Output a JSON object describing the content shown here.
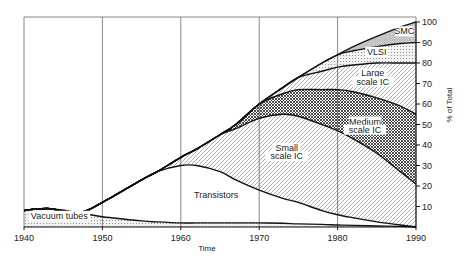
{
  "chart_data": {
    "type": "area",
    "stacked": true,
    "title": "",
    "xlabel": "Time",
    "ylabel": "% of Total",
    "xlim": [
      1940,
      1990
    ],
    "ylim": [
      0,
      100
    ],
    "x_ticks": [
      1940,
      1950,
      1960,
      1970,
      1980,
      1990
    ],
    "y_ticks": [
      10,
      20,
      30,
      40,
      50,
      60,
      70,
      80,
      90,
      100
    ],
    "grid": {
      "vertical": true,
      "horizontal": false
    },
    "y_axis_position": "right",
    "x": [
      1940,
      1943,
      1947,
      1950,
      1955,
      1957,
      1960,
      1962,
      1965,
      1967,
      1970,
      1973,
      1975,
      1978,
      1980,
      1982,
      1985,
      1988,
      1990
    ],
    "series": [
      {
        "name": "Vacuum tubes",
        "pattern": "dots",
        "top": [
          8,
          9,
          7,
          5,
          3,
          2.5,
          2,
          2,
          2,
          2,
          2,
          1.8,
          1.5,
          1.3,
          1,
          0.8,
          0.5,
          0.3,
          0
        ]
      },
      {
        "name": "Transistors",
        "pattern": "none",
        "top": [
          8,
          9,
          7,
          12,
          23,
          27,
          30,
          30,
          27,
          23,
          18,
          14,
          12,
          8,
          6,
          4.5,
          2.5,
          1,
          0
        ]
      },
      {
        "name": "Small scale IC",
        "pattern": "diagonal",
        "top": [
          8,
          9,
          7,
          12,
          23,
          27,
          34,
          38,
          45,
          48,
          53,
          55,
          54,
          50,
          47,
          43,
          36,
          27,
          21
        ]
      },
      {
        "name": "Medium scale IC",
        "pattern": "crosshatch",
        "top": [
          8,
          9,
          7,
          12,
          23,
          27,
          34,
          38,
          45,
          50,
          60,
          65,
          67,
          67,
          67,
          66,
          63,
          59,
          55
        ]
      },
      {
        "name": "Large scale IC",
        "pattern": "diagonal",
        "top": [
          8,
          9,
          7,
          12,
          23,
          27,
          34,
          38,
          45,
          50,
          60,
          68,
          73,
          76,
          78,
          79,
          80,
          80,
          80
        ]
      },
      {
        "name": "VLSI",
        "pattern": "dots",
        "top": [
          8,
          9,
          7,
          12,
          23,
          27,
          34,
          38,
          45,
          50,
          60,
          68,
          73,
          80,
          84,
          86,
          88,
          89.5,
          90
        ]
      },
      {
        "name": "SMC",
        "pattern": "crosshatch-fine",
        "top": [
          8,
          9,
          7,
          12,
          23,
          27,
          34,
          38,
          45,
          50,
          60,
          68,
          73,
          80,
          84,
          88,
          93,
          97.5,
          100
        ]
      }
    ],
    "region_labels": [
      {
        "text": "Vacuum tubes",
        "x": 1944.5,
        "y": 4
      },
      {
        "text": "Transistors",
        "x": 1964.5,
        "y": 14
      },
      {
        "text": "Small",
        "x": 1973.5,
        "y": 37
      },
      {
        "text": "scale IC",
        "x": 1973.5,
        "y": 33
      },
      {
        "text": "Medium",
        "x": 1983.5,
        "y": 50
      },
      {
        "text": "scale IC",
        "x": 1983.5,
        "y": 46
      },
      {
        "text": "Large",
        "x": 1984.5,
        "y": 73.5
      },
      {
        "text": "scale IC",
        "x": 1984.5,
        "y": 69.5
      },
      {
        "text": "VLSI",
        "x": 1985,
        "y": 84
      },
      {
        "text": "SMC",
        "x": 1988.5,
        "y": 94
      }
    ]
  }
}
